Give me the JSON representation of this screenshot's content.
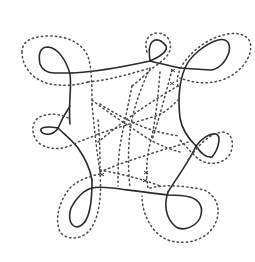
{
  "diagram": {
    "type": "curve-diagram",
    "colors": {
      "background": "#ffffff",
      "solid_stroke": "#2b2b2b",
      "dotted_stroke": "#4a4a4a"
    },
    "solid_curve": {
      "style": "solid",
      "loops": [
        {
          "name": "top-left-loop",
          "center": [
            50,
            58
          ]
        },
        {
          "name": "top-small-loop",
          "center": [
            157,
            45
          ]
        },
        {
          "name": "top-right-loop",
          "center": [
            215,
            52
          ]
        },
        {
          "name": "right-small-loop",
          "center": [
            216,
            148
          ]
        },
        {
          "name": "bottom-right-loop",
          "center": [
            184,
            212
          ]
        },
        {
          "name": "bottom-left-loop",
          "center": [
            78,
            210
          ]
        },
        {
          "name": "left-small-loop",
          "center": [
            46,
            128
          ]
        }
      ]
    },
    "dotted_curves": {
      "style": "dotted",
      "count_outer_rings": 7,
      "interior_web": true
    },
    "text_labels": []
  }
}
